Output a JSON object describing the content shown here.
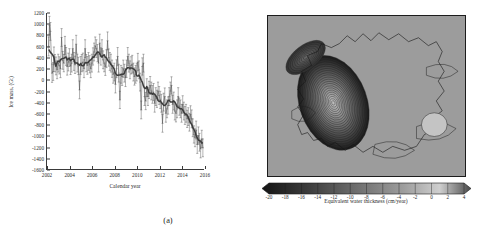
{
  "figure": {
    "panels": [
      {
        "caption": "(a)"
      },
      {
        "caption": "(b)"
      }
    ]
  },
  "chart_data": [
    {
      "type": "line",
      "panel": "(a)",
      "title": "",
      "xlabel": "Calendar year",
      "ylabel": "Ice mass, (Gt)",
      "xlim": [
        2002,
        2016
      ],
      "ylim": [
        -1600,
        1200
      ],
      "xticks": [
        2002,
        2004,
        2006,
        2008,
        2010,
        2012,
        2014,
        2016
      ],
      "yticks": [
        1200,
        1000,
        800,
        600,
        400,
        200,
        0,
        -200,
        -400,
        -600,
        -800,
        -1000,
        -1200,
        -1400,
        -1600
      ],
      "grid": false,
      "legend": "none",
      "marker": "plus",
      "errorbars": "vertical",
      "series": [
        {
          "name": "Ice mass anomaly",
          "color": "#555555",
          "x": [
            2002.15,
            2002.22,
            2002.3,
            2002.45,
            2002.55,
            2002.62,
            2002.7,
            2002.8,
            2002.9,
            2003.0,
            2003.1,
            2003.2,
            2003.3,
            2003.4,
            2003.5,
            2003.6,
            2003.7,
            2003.8,
            2003.9,
            2004.0,
            2004.1,
            2004.2,
            2004.3,
            2004.4,
            2004.5,
            2004.6,
            2004.7,
            2004.8,
            2004.9,
            2005.0,
            2005.1,
            2005.2,
            2005.3,
            2005.4,
            2005.5,
            2005.6,
            2005.7,
            2005.8,
            2005.9,
            2006.0,
            2006.1,
            2006.2,
            2006.3,
            2006.4,
            2006.5,
            2006.6,
            2006.7,
            2006.8,
            2006.9,
            2007.0,
            2007.1,
            2007.2,
            2007.3,
            2007.4,
            2007.5,
            2007.6,
            2007.7,
            2007.8,
            2007.9,
            2008.0,
            2008.1,
            2008.2,
            2008.3,
            2008.4,
            2008.5,
            2008.6,
            2008.7,
            2008.8,
            2008.9,
            2009.0,
            2009.1,
            2009.2,
            2009.3,
            2009.4,
            2009.5,
            2009.6,
            2009.7,
            2009.8,
            2009.9,
            2010.0,
            2010.1,
            2010.2,
            2010.3,
            2010.4,
            2010.5,
            2010.6,
            2010.7,
            2010.8,
            2010.9,
            2011.0,
            2011.1,
            2011.2,
            2011.3,
            2011.4,
            2011.5,
            2011.6,
            2011.7,
            2011.8,
            2011.9,
            2012.0,
            2012.1,
            2012.2,
            2012.3,
            2012.4,
            2012.5,
            2012.6,
            2012.7,
            2012.8,
            2012.9,
            2013.0,
            2013.1,
            2013.2,
            2013.3,
            2013.4,
            2013.5,
            2013.6,
            2013.7,
            2013.8,
            2013.9,
            2014.0,
            2014.1,
            2014.2,
            2014.3,
            2014.4,
            2014.5,
            2014.6,
            2014.7,
            2014.8,
            2014.9,
            2015.0,
            2015.1,
            2015.2,
            2015.3,
            2015.4,
            2015.5,
            2015.6,
            2015.7,
            2015.8,
            2015.9
          ],
          "y": [
            600,
            980,
            870,
            120,
            150,
            430,
            300,
            250,
            180,
            300,
            260,
            200,
            760,
            350,
            300,
            620,
            420,
            240,
            320,
            400,
            250,
            300,
            560,
            330,
            270,
            640,
            300,
            250,
            -180,
            260,
            300,
            320,
            200,
            560,
            300,
            260,
            330,
            280,
            200,
            300,
            420,
            500,
            610,
            560,
            480,
            300,
            660,
            420,
            560,
            360,
            300,
            240,
            380,
            700,
            400,
            330,
            300,
            200,
            100,
            140,
            -80,
            200,
            420,
            120,
            -360,
            100,
            60,
            200,
            120,
            40,
            200,
            420,
            300,
            180,
            260,
            280,
            140,
            60,
            100,
            140,
            320,
            180,
            -40,
            -540,
            240,
            300,
            -300,
            -380,
            -140,
            -300,
            -180,
            -100,
            -200,
            -260,
            -220,
            -420,
            -300,
            -340,
            -200,
            -280,
            -360,
            -420,
            -780,
            -400,
            -300,
            -600,
            -520,
            -460,
            -300,
            -200,
            -100,
            -440,
            -380,
            -560,
            -600,
            -520,
            -300,
            -480,
            -520,
            -600,
            -440,
            -560,
            -640,
            -600,
            -700,
            -660,
            -760,
            -620,
            -700,
            -860,
            -980,
            -1040,
            -900,
            -1160,
            -1000,
            -1120,
            -1240,
            -1060,
            -1220
          ],
          "yerr": [
            170,
            160,
            160,
            165,
            160,
            160,
            155,
            160,
            160,
            160,
            155,
            160,
            160,
            160,
            155,
            160,
            160,
            155,
            160,
            160,
            155,
            160,
            160,
            160,
            155,
            160,
            160,
            155,
            160,
            160,
            155,
            160,
            160,
            160,
            155,
            160,
            160,
            155,
            160,
            160,
            155,
            160,
            160,
            160,
            155,
            160,
            160,
            155,
            160,
            160,
            155,
            160,
            160,
            160,
            155,
            160,
            160,
            155,
            160,
            160,
            155,
            160,
            160,
            160,
            155,
            160,
            160,
            155,
            160,
            160,
            155,
            160,
            160,
            160,
            155,
            160,
            160,
            155,
            160,
            160,
            155,
            160,
            160,
            160,
            155,
            160,
            160,
            155,
            160,
            160,
            155,
            160,
            160,
            160,
            155,
            160,
            160,
            155,
            160,
            160,
            155,
            160,
            160,
            160,
            155,
            160,
            160,
            155,
            160,
            160,
            155,
            160,
            160,
            160,
            155,
            160,
            160,
            155,
            160,
            160,
            155,
            160,
            160,
            160,
            155,
            160,
            160,
            155,
            160,
            160,
            155,
            160,
            160,
            160,
            155,
            160,
            160,
            155,
            160
          ]
        }
      ]
    },
    {
      "type": "heatmap",
      "panel": "(b)",
      "title": "",
      "colorbar_label": "Equivalent water thickness (cm/year)",
      "colorbar_ticks": [
        -20,
        -18,
        -16,
        -14,
        -12,
        -10,
        -8,
        -6,
        -4,
        -2,
        0,
        2,
        4
      ],
      "colorbar_min": -20,
      "colorbar_max": 4,
      "colormap": "grayscale",
      "contours": true,
      "description": "Antarctic ice sheet mass change map with concentric contours over West Antarctica"
    }
  ]
}
